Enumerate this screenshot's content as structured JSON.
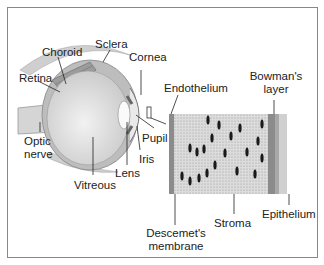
{
  "diagram": {
    "eye_labels": {
      "sclera": "Sclera",
      "choroid": "Choroid",
      "retina": "Retina",
      "cornea": "Cornea",
      "optic_nerve_line1": "Optic",
      "optic_nerve_line2": "nerve",
      "vitreous": "Vitreous",
      "lens": "Lens",
      "iris": "Iris",
      "pupil": "Pupil"
    },
    "cornea_labels": {
      "endothelium": "Endothelium",
      "bowmans_line1": "Bowman's",
      "bowmans_line2": "layer",
      "stroma": "Stroma",
      "epithelium": "Epithelium",
      "descemets_line1": "Descemet's",
      "descemets_line2": "membrane"
    },
    "colors": {
      "line": "#222222",
      "stroma": "#d8d8d8",
      "bowman": "#9a9a9a",
      "epithelium": "#c8c8c8",
      "eye_fill": "#e6e6e6",
      "sclera": "#bdbdbd"
    }
  }
}
